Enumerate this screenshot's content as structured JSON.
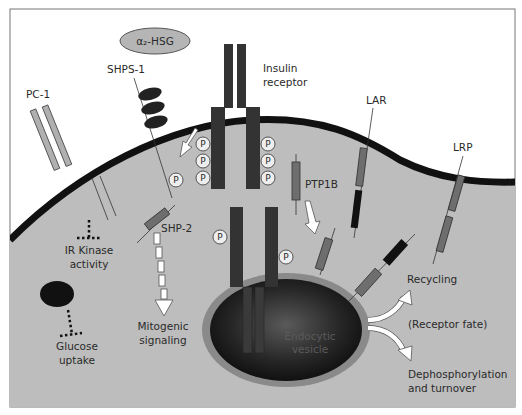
{
  "diagram": {
    "colors": {
      "background": "#ffffff",
      "cytoplasm": "#bdbdbd",
      "membrane": "#111111",
      "receptor_dark": "#333333",
      "component_gray": "#6e6e6e",
      "pc1_light": "#b0b0b0",
      "vesicle_rim": "#8a8a8a",
      "vesicle_core": "#111111",
      "arrow_fill": "#ffffff",
      "frame": "#777777"
    },
    "labels": {
      "a2hsg": "α₂-HSG",
      "shps1": "SHPS-1",
      "pc1": "PC-1",
      "insulin_receptor_line1": "Insulin",
      "insulin_receptor_line2": "receptor",
      "lar": "LAR",
      "lrp": "LRP",
      "ptp1b": "PTP1B",
      "shp2": "SHP-2",
      "ir_kinase_line1": "IR Kinase",
      "ir_kinase_line2": "activity",
      "glucose_line1": "Glucose",
      "glucose_line2": "uptake",
      "mitogenic_line1": "Mitogenic",
      "mitogenic_line2": "signaling",
      "vesicle_line1": "Endocytic",
      "vesicle_line2": "vesicle",
      "recycling": "Recycling",
      "receptor_fate": "(Receptor fate)",
      "dephos_line1": "Dephosphorylation",
      "dephos_line2": "and turnover",
      "phospho": "P"
    }
  }
}
